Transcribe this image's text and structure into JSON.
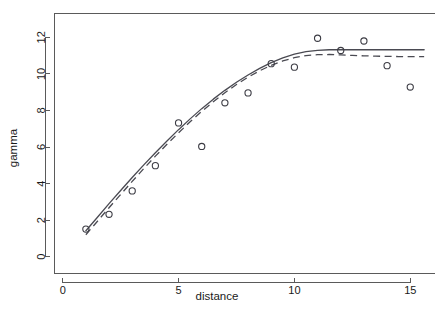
{
  "chart_data": {
    "type": "scatter",
    "title": "",
    "subtitle": "",
    "xlabel": "distance",
    "ylabel": "gamma",
    "xlim": [
      -0.35,
      16.1
    ],
    "ylim": [
      -0.9,
      13.3
    ],
    "xticks": [
      0,
      5,
      10,
      15
    ],
    "xtick_labels": [
      "0",
      "5",
      "10",
      "15"
    ],
    "yticks": [
      0,
      2,
      4,
      6,
      8,
      10,
      12
    ],
    "ytick_labels": [
      "0",
      "2",
      "4",
      "6",
      "8",
      "10",
      "12"
    ],
    "grid": false,
    "legend": "none",
    "frame": "box",
    "x": [
      1,
      2,
      3,
      4,
      5,
      6,
      7,
      8,
      9,
      10,
      11,
      12,
      13,
      14,
      15
    ],
    "points": {
      "name": "empirical semivariogram",
      "marker": "open-circle",
      "values": [
        1.51,
        2.32,
        3.6,
        4.98,
        7.32,
        6.03,
        8.42,
        8.96,
        10.56,
        10.37,
        11.95,
        11.28,
        11.8,
        10.45,
        9.28
      ]
    },
    "series": [
      {
        "name": "fitted model (solid)",
        "style": "solid",
        "x": [
          1,
          1.5,
          2,
          2.5,
          3,
          3.5,
          4,
          4.5,
          5,
          5.5,
          6,
          6.5,
          7,
          7.5,
          8,
          8.5,
          9,
          9.5,
          10,
          10.5,
          11,
          11.5,
          12,
          12.5,
          13,
          13.5,
          14,
          14.5,
          15,
          15.6
        ],
        "values": [
          1.42,
          2.16,
          2.9,
          3.62,
          4.33,
          5.02,
          5.69,
          6.33,
          6.95,
          7.54,
          8.1,
          8.62,
          9.1,
          9.54,
          9.94,
          10.3,
          10.62,
          10.88,
          11.08,
          11.22,
          11.29,
          11.32,
          11.32,
          11.32,
          11.32,
          11.32,
          11.32,
          11.32,
          11.32,
          11.32
        ]
      },
      {
        "name": "fitted model (dashed)",
        "style": "dashed",
        "x": [
          1,
          1.5,
          2,
          2.5,
          3,
          3.5,
          4,
          4.5,
          5,
          5.5,
          6,
          6.5,
          7,
          7.5,
          8,
          8.5,
          9,
          9.5,
          10,
          10.5,
          11,
          11.5,
          12,
          12.5,
          13,
          13.5,
          14,
          14.5,
          15,
          15.6
        ],
        "values": [
          1.2,
          1.94,
          2.68,
          3.4,
          4.12,
          4.82,
          5.5,
          6.15,
          6.78,
          7.38,
          7.95,
          8.48,
          8.97,
          9.42,
          9.82,
          10.17,
          10.47,
          10.71,
          10.89,
          11.0,
          11.05,
          11.06,
          11.04,
          11.01,
          10.99,
          10.97,
          10.96,
          10.95,
          10.95,
          10.95
        ]
      }
    ]
  },
  "axes": {
    "x_title": "distance",
    "y_title": "gamma"
  }
}
